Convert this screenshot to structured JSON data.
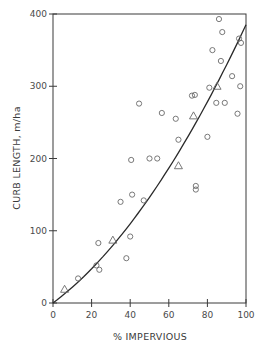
{
  "chart_data": {
    "type": "scatter",
    "title": "",
    "xlabel": "% IMPERVIOUS",
    "ylabel": "CURB LENGTH, m/ha",
    "xlim": [
      0,
      100
    ],
    "ylim": [
      0,
      400
    ],
    "x_ticks": [
      0,
      20,
      40,
      60,
      80,
      100
    ],
    "y_ticks": [
      0,
      100,
      200,
      300,
      400
    ],
    "x_tick_labels": [
      "0",
      "20",
      "40",
      "60",
      "80",
      "100"
    ],
    "y_tick_labels": [
      "0",
      "100",
      "200",
      "300",
      "400"
    ],
    "grid": false,
    "legend": null,
    "series": [
      {
        "name": "circles",
        "marker": "circle",
        "points": [
          [
            13,
            34
          ],
          [
            22.5,
            52
          ],
          [
            24,
            46
          ],
          [
            23.5,
            83
          ],
          [
            38,
            62
          ],
          [
            40,
            92
          ],
          [
            35,
            140
          ],
          [
            41,
            150
          ],
          [
            47,
            142
          ],
          [
            40.5,
            198
          ],
          [
            50,
            200
          ],
          [
            54,
            200
          ],
          [
            44.6,
            276
          ],
          [
            56.4,
            263
          ],
          [
            63.6,
            255
          ],
          [
            65,
            226
          ],
          [
            74,
            162
          ],
          [
            74,
            157
          ],
          [
            72,
            287
          ],
          [
            73.5,
            288
          ],
          [
            80,
            230
          ],
          [
            81,
            298
          ],
          [
            84.6,
            277
          ],
          [
            89,
            277
          ],
          [
            82.6,
            350
          ],
          [
            87,
            335
          ],
          [
            86,
            393
          ],
          [
            87.7,
            375
          ],
          [
            92.8,
            314
          ],
          [
            95.6,
            262
          ],
          [
            96.4,
            366
          ],
          [
            97.4,
            360
          ],
          [
            97,
            300
          ]
        ]
      },
      {
        "name": "triangles",
        "marker": "triangle",
        "points": [
          [
            6,
            19
          ],
          [
            31,
            87
          ],
          [
            65,
            190
          ],
          [
            72.8,
            259
          ],
          [
            85,
            300
          ]
        ]
      },
      {
        "name": "fitted curve",
        "type": "line",
        "equation": "y = 2.0x + 0.0185x^2",
        "points": [
          [
            0,
            0
          ],
          [
            10,
            21.9
          ],
          [
            20,
            47.4
          ],
          [
            30,
            76.7
          ],
          [
            40,
            109.6
          ],
          [
            50,
            146.3
          ],
          [
            60,
            186.6
          ],
          [
            70,
            230.7
          ],
          [
            80,
            278.4
          ],
          [
            90,
            329.9
          ],
          [
            100,
            385
          ]
        ]
      }
    ]
  },
  "colors": {
    "axis": "#3a3a3a",
    "marker": "#6a6a6a",
    "curve": "#2a2a2a",
    "background": "#ffffff"
  }
}
